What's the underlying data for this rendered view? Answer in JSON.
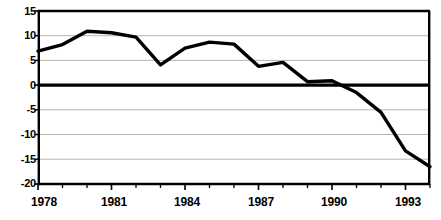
{
  "chart_data": {
    "type": "line",
    "title": "",
    "subtitle": "",
    "xlabel": "",
    "ylabel": "",
    "x": [
      1978,
      1979,
      1980,
      1981,
      1982,
      1983,
      1984,
      1985,
      1986,
      1987,
      1988,
      1989,
      1990,
      1991,
      1992,
      1993,
      1994
    ],
    "values": [
      6.9,
      8.2,
      10.9,
      10.6,
      9.7,
      4.1,
      7.5,
      8.7,
      8.3,
      3.8,
      4.6,
      0.7,
      0.9,
      -1.5,
      -5.5,
      -13.3,
      -16.5
    ],
    "series": [
      {
        "name": "",
        "values": [
          6.9,
          8.2,
          10.9,
          10.6,
          9.7,
          4.1,
          7.5,
          8.7,
          8.3,
          3.8,
          4.6,
          0.7,
          0.9,
          -1.5,
          -5.5,
          -13.3,
          -16.5
        ]
      }
    ],
    "xlim": [
      1978,
      1994
    ],
    "ylim": [
      -20,
      15
    ],
    "y_ticks": [
      15,
      10,
      5,
      0,
      -5,
      -10,
      -15,
      -20
    ],
    "y_tick_labels": [
      "15",
      "10",
      "5",
      "0",
      "-5",
      "-10",
      "-15",
      "-20"
    ],
    "x_ticks": [
      1978,
      1979,
      1980,
      1981,
      1982,
      1983,
      1984,
      1985,
      1986,
      1987,
      1988,
      1989,
      1990,
      1991,
      1992,
      1993,
      1994
    ],
    "x_major_ticks": [
      1978,
      1981,
      1984,
      1987,
      1990,
      1993
    ],
    "x_tick_labels": [
      "1978",
      "1981",
      "1984",
      "1987",
      "1990",
      "1993"
    ],
    "grid": true,
    "grid_axis": "y",
    "legend": false,
    "legend_position": "none",
    "annotations": [],
    "colors": {
      "line": "#000000",
      "grid": "#b4b4b4",
      "axis": "#000000",
      "zero_line": "#000000",
      "background": "#ffffff",
      "text": "#000000"
    },
    "style": {
      "line_width": 3.4,
      "zero_line_width": 3.0,
      "axis_line_width": 2.2,
      "grid_line_width": 1.0
    }
  },
  "geometry": {
    "plot_left": 38,
    "plot_right": 430,
    "plot_top": 11,
    "plot_bottom": 184
  }
}
